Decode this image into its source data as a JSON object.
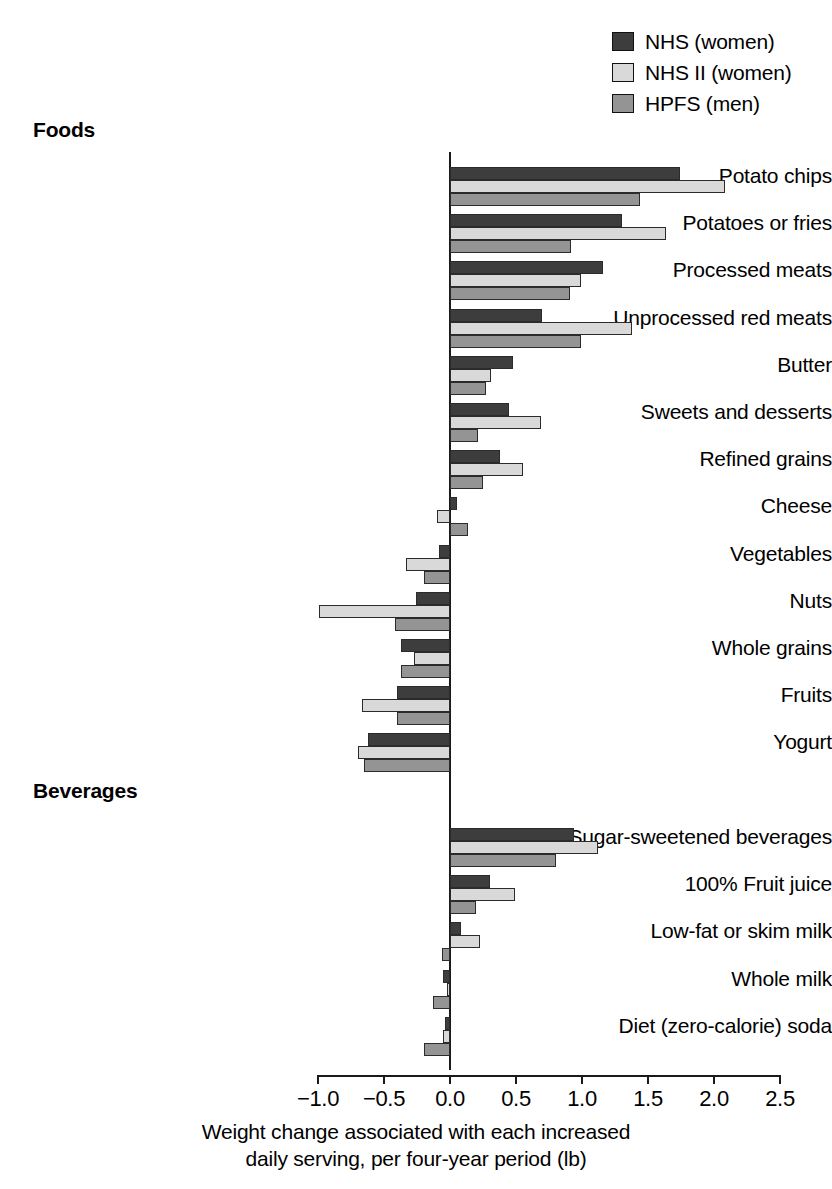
{
  "chart_data": {
    "type": "bar",
    "orientation": "horizontal",
    "title": "",
    "xlabel": "Weight change associated with each increased daily serving, per four-year period (lb)",
    "xlabel_line1": "Weight change associated with each increased",
    "xlabel_line2": "daily serving, per four-year period (lb)",
    "ylabel": "",
    "xlim": [
      -1.0,
      2.5
    ],
    "xticks": [
      "−1.0",
      "−0.5",
      "0.0",
      "0.5",
      "1.0",
      "1.5",
      "2.0",
      "2.5"
    ],
    "xtick_values": [
      -1.0,
      -0.5,
      0.0,
      0.5,
      1.0,
      1.5,
      2.0,
      2.5
    ],
    "grid": false,
    "legend_position": "top-right",
    "series": [
      {
        "name": "NHS (women)",
        "color": "#3d3d3d"
      },
      {
        "name": "NHS II (women)",
        "color": "#d9d9d9"
      },
      {
        "name": "HPFS (men)",
        "color": "#949494"
      }
    ],
    "groups": [
      {
        "heading": "Foods",
        "categories": [
          {
            "label": "Potato chips",
            "values": [
              1.74,
              2.08,
              1.44
            ]
          },
          {
            "label": "Potatoes or fries",
            "values": [
              1.3,
              1.64,
              0.92
            ]
          },
          {
            "label": "Processed meats",
            "values": [
              1.16,
              0.99,
              0.91
            ]
          },
          {
            "label": "Unprocessed red meats",
            "values": [
              0.7,
              1.38,
              0.99
            ]
          },
          {
            "label": "Butter",
            "values": [
              0.48,
              0.31,
              0.27
            ]
          },
          {
            "label": "Sweets and desserts",
            "values": [
              0.45,
              0.69,
              0.21
            ]
          },
          {
            "label": "Refined grains",
            "values": [
              0.38,
              0.55,
              0.25
            ]
          },
          {
            "label": "Cheese",
            "values": [
              0.05,
              -0.1,
              0.14
            ]
          },
          {
            "label": "Vegetables",
            "values": [
              -0.08,
              -0.33,
              -0.2
            ]
          },
          {
            "label": "Nuts",
            "values": [
              -0.26,
              -0.99,
              -0.42
            ]
          },
          {
            "label": "Whole grains",
            "values": [
              -0.37,
              -0.27,
              -0.37
            ]
          },
          {
            "label": "Fruits",
            "values": [
              -0.4,
              -0.67,
              -0.4
            ]
          },
          {
            "label": "Yogurt",
            "values": [
              -0.62,
              -0.7,
              -0.65
            ]
          }
        ]
      },
      {
        "heading": "Beverages",
        "categories": [
          {
            "label": "Sugar-sweetened beverages",
            "values": [
              0.94,
              1.12,
              0.8
            ]
          },
          {
            "label": "100% Fruit juice",
            "values": [
              0.3,
              0.49,
              0.2
            ]
          },
          {
            "label": "Low-fat or skim milk",
            "values": [
              0.08,
              0.23,
              -0.06
            ]
          },
          {
            "label": "Whole milk",
            "values": [
              -0.05,
              -0.02,
              -0.13
            ]
          },
          {
            "label": "Diet (zero-calorie) soda",
            "values": [
              -0.04,
              -0.05,
              -0.2
            ]
          }
        ]
      }
    ]
  }
}
